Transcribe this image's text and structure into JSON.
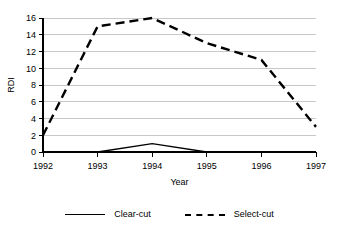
{
  "chart_data": {
    "type": "line",
    "title": "",
    "xlabel": "Year",
    "ylabel": "RDI",
    "categories": [
      "1992",
      "1993",
      "1994",
      "1995",
      "1996",
      "1997"
    ],
    "x": [
      1992,
      1993,
      1994,
      1995,
      1996,
      1997
    ],
    "series": [
      {
        "name": "Clear-cut",
        "style": "solid",
        "color": "#000000",
        "values": [
          0,
          0,
          1,
          0,
          0,
          0
        ]
      },
      {
        "name": "Select-cut",
        "style": "dashed",
        "color": "#000000",
        "values": [
          2,
          15,
          16,
          13,
          11,
          3
        ]
      }
    ],
    "ylim": [
      0,
      16
    ],
    "yticks": [
      0,
      2,
      4,
      6,
      8,
      10,
      12,
      14,
      16
    ],
    "ytick_labels": [
      "0",
      "2",
      "4",
      "6",
      "8",
      "10",
      "12",
      "14",
      "16"
    ],
    "xtick_labels": [
      "1992",
      "1993",
      "1994",
      "1995",
      "1996",
      "1997"
    ],
    "grid": "horizontal",
    "grid_color": "#c8c8c8",
    "legend_position": "bottom",
    "legend_entries": [
      "Clear-cut",
      "Select-cut"
    ],
    "background": "#ffffff"
  },
  "legend": {
    "clear_cut_label": "Clear-cut",
    "select_cut_label": "Select-cut"
  },
  "axes": {
    "y_title": "RDI",
    "x_title": "Year"
  }
}
